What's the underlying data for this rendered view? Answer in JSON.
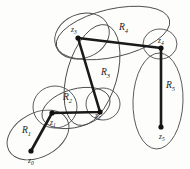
{
  "figure": {
    "stroke_color": "#1a1a1a",
    "region_stroke_color": "#4a4a4a",
    "background": "#fdfdfc"
  },
  "regions": [
    {
      "id": "R1",
      "label": "R",
      "sub": "1",
      "label_x": 22,
      "label_y": 133,
      "cx": 38,
      "cy": 135,
      "rx": 33,
      "ry": 22,
      "rotate": -28
    },
    {
      "id": "R2",
      "label": "R",
      "sub": "2",
      "label_x": 63,
      "label_y": 100,
      "cx": 76,
      "cy": 108,
      "rx": 35,
      "ry": 19,
      "rotate": -16
    },
    {
      "id": "R3",
      "label": "R",
      "sub": "3",
      "label_x": 101,
      "label_y": 75,
      "cx": 92,
      "cy": 75,
      "rx": 25,
      "ry": 52,
      "rotate": 16
    },
    {
      "id": "R4",
      "label": "R",
      "sub": "4",
      "label_x": 119,
      "label_y": 30,
      "cx": 113,
      "cy": 33,
      "rx": 58,
      "ry": 24,
      "rotate": -13
    },
    {
      "id": "R5",
      "label": "R",
      "sub": "5",
      "label_x": 166,
      "label_y": 88,
      "cx": 158,
      "cy": 101,
      "rx": 25,
      "ry": 48,
      "rotate": 2
    },
    {
      "id": "R1R2-lens",
      "label": "",
      "sub": "",
      "label_x": 0,
      "label_y": 0,
      "cx": 55,
      "cy": 107,
      "rx": 22,
      "ry": 21,
      "rotate": 0
    },
    {
      "id": "R3R4-lens",
      "label": "",
      "sub": "",
      "label_x": 0,
      "label_y": 0,
      "cx": 82,
      "cy": 36,
      "rx": 28,
      "ry": 22,
      "rotate": -22
    },
    {
      "id": "R2R3-lens",
      "label": "",
      "sub": "",
      "label_x": 0,
      "label_y": 0,
      "cx": 103,
      "cy": 104,
      "rx": 17,
      "ry": 16,
      "rotate": 0
    },
    {
      "id": "R4R5-lens",
      "label": "",
      "sub": "",
      "label_x": 0,
      "label_y": 0,
      "cx": 160,
      "cy": 44,
      "rx": 17,
      "ry": 15,
      "rotate": 0
    }
  ],
  "nodes": [
    {
      "id": "z0",
      "label": "z",
      "sub": "0",
      "x": 31,
      "y": 151,
      "label_x": 28,
      "label_y": 163
    },
    {
      "id": "z1",
      "label": "z",
      "sub": "1",
      "x": 52,
      "y": 113,
      "label_x": 50,
      "label_y": 125
    },
    {
      "id": "z2",
      "label": "z",
      "sub": "2",
      "x": 100,
      "y": 112,
      "label_x": 95,
      "label_y": 118
    },
    {
      "id": "z3",
      "label": "z",
      "sub": "3",
      "x": 78,
      "y": 38,
      "label_x": 71,
      "label_y": 32
    },
    {
      "id": "z4",
      "label": "z",
      "sub": "4",
      "x": 161,
      "y": 48,
      "label_x": 158,
      "label_y": 43
    },
    {
      "id": "z5",
      "label": "z",
      "sub": "5",
      "x": 161,
      "y": 127,
      "label_x": 159,
      "label_y": 139
    }
  ],
  "path": {
    "description": "z0 - z1 - z2 - z3 - z4 - z5",
    "points": "31,151 52,113 100,112 78,38 161,48 161,127"
  }
}
